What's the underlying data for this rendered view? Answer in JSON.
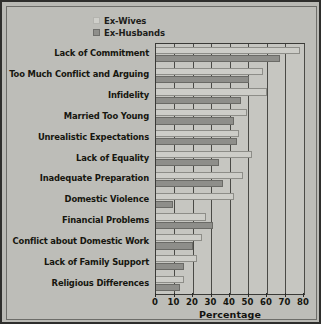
{
  "chart_data": {
    "type": "bar",
    "orientation": "horizontal",
    "title": "",
    "xlabel": "Percentage",
    "ylabel": "",
    "xlim": [
      0,
      80
    ],
    "xticks": [
      0,
      10,
      20,
      30,
      40,
      50,
      60,
      70,
      80
    ],
    "grid": true,
    "legend_position": "top",
    "categories": [
      "Lack of Commitment",
      "Too Much Conflict and Arguing",
      "Infidelity",
      "Married Too Young",
      "Unrealistic Expectations",
      "Lack of Equality",
      "Inadequate Preparation",
      "Domestic Violence",
      "Financial Problems",
      "Conflict about Domestic Work",
      "Lack of Family Support",
      "Religious Differences"
    ],
    "series": [
      {
        "name": "Ex-Wives",
        "color": "#cdcdc8",
        "values": [
          78,
          58,
          60,
          49,
          45,
          52,
          47,
          42,
          27,
          25,
          22,
          15
        ]
      },
      {
        "name": "Ex-Husbands",
        "color": "#8e8e8a",
        "values": [
          67,
          50,
          46,
          42,
          44,
          34,
          36,
          9,
          31,
          20,
          15,
          13
        ]
      }
    ]
  },
  "legend": {
    "items": [
      {
        "label": "Ex-Wives",
        "swatch": "wives"
      },
      {
        "label": "Ex-Husbands",
        "swatch": "husbands"
      }
    ]
  },
  "axis": {
    "xlabel": "Percentage"
  }
}
